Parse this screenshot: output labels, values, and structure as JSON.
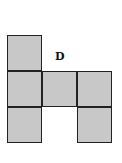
{
  "diagram": {
    "type": "net-of-cube",
    "fill_color": "#c8c8c8",
    "border_color": "#222222",
    "label": "D",
    "cells": [
      {
        "row": 0,
        "col": 0
      },
      {
        "row": 1,
        "col": 0
      },
      {
        "row": 1,
        "col": 1
      },
      {
        "row": 1,
        "col": 2
      },
      {
        "row": 2,
        "col": 0
      },
      {
        "row": 2,
        "col": 2
      }
    ]
  }
}
